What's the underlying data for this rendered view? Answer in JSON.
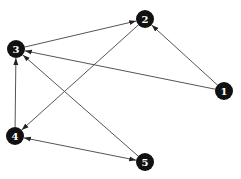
{
  "diagram": {
    "type": "directed-graph",
    "background": "#ffffff",
    "edge_color": "#555555",
    "node_fill": "#111111",
    "node_label_color": "#ffffff",
    "nodes": [
      {
        "id": "1",
        "label": "1",
        "x": 224,
        "y": 91
      },
      {
        "id": "2",
        "label": "2",
        "x": 145,
        "y": 19
      },
      {
        "id": "3",
        "label": "3",
        "x": 16,
        "y": 49
      },
      {
        "id": "4",
        "label": "4",
        "x": 15,
        "y": 136
      },
      {
        "id": "5",
        "label": "5",
        "x": 145,
        "y": 162
      }
    ],
    "edges": [
      {
        "from": "1",
        "to": "2",
        "bidirectional": false
      },
      {
        "from": "1",
        "to": "3",
        "bidirectional": false
      },
      {
        "from": "3",
        "to": "2",
        "bidirectional": false
      },
      {
        "from": "2",
        "to": "4",
        "bidirectional": false
      },
      {
        "from": "4",
        "to": "3",
        "bidirectional": false
      },
      {
        "from": "5",
        "to": "3",
        "bidirectional": false
      },
      {
        "from": "4",
        "to": "5",
        "bidirectional": true
      }
    ]
  }
}
